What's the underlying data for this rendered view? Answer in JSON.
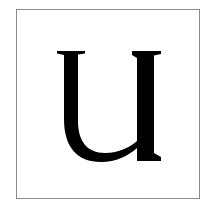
{
  "card": {
    "letter": "U",
    "letter_color": "#000000",
    "border_color": "#8a8a8a",
    "background_color": "#ffffff"
  }
}
